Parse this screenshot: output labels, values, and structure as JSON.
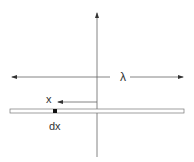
{
  "diagram": {
    "labels": {
      "lambda": "λ",
      "x": "x",
      "dx": "dx"
    },
    "colors": {
      "line": "#555555",
      "text": "#333333",
      "rod_fill": "#ffffff",
      "element": "#111111"
    }
  }
}
